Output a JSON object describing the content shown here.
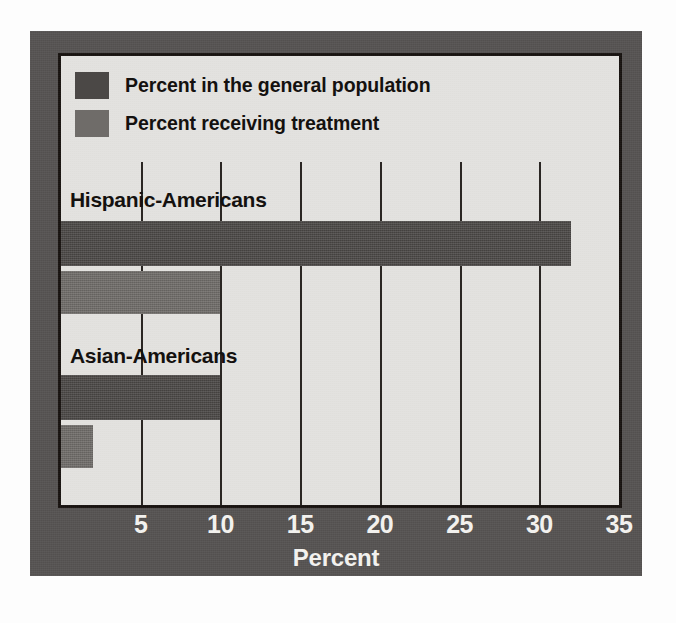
{
  "chart_data": {
    "type": "bar",
    "orientation": "horizontal",
    "title": "",
    "xlabel": "Percent",
    "ylabel": "",
    "xlim": [
      0,
      35
    ],
    "xticks": [
      5,
      10,
      15,
      20,
      25,
      30,
      35
    ],
    "xtick_labels": [
      "5",
      "10",
      "15",
      "20",
      "25",
      "30",
      "35"
    ],
    "grid": true,
    "grid_axis": "x",
    "legend_position": "top-left",
    "categories": [
      "Hispanic-Americans",
      "Asian-Americans"
    ],
    "series": [
      {
        "name": "Percent in the general population",
        "color": "#4b4846",
        "values": [
          32,
          10
        ]
      },
      {
        "name": "Percent receiving treatment",
        "color": "#6f6c69",
        "values": [
          10,
          2
        ]
      }
    ]
  },
  "legend": {
    "items": [
      {
        "label": "Percent in the general population",
        "color": "#4b4846"
      },
      {
        "label": "Percent receiving treatment",
        "color": "#6f6c69"
      }
    ]
  },
  "axis": {
    "x_title": "Percent",
    "ticks": [
      "5",
      "10",
      "15",
      "20",
      "25",
      "30",
      "35"
    ]
  },
  "categories": [
    {
      "label": "Hispanic-Americans"
    },
    {
      "label": "Asian-Americans"
    }
  ],
  "colors": {
    "frame": "#565352",
    "plot_background": "#e6e5e1",
    "plot_border": "#17120f",
    "series_general": "#4b4846",
    "series_treatment": "#6f6c69",
    "tick_text": "#f2f1ee"
  }
}
